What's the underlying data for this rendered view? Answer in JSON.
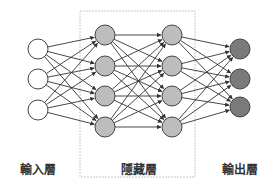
{
  "diagram": {
    "layers": [
      {
        "id": "input",
        "label": "輸入層",
        "x": 38,
        "nodes": [
          49,
          79,
          110
        ],
        "fill": "#ffffff"
      },
      {
        "id": "hidden1",
        "label": "",
        "x": 105,
        "nodes": [
          35,
          66,
          96,
          127
        ],
        "fill": "#bdbdbd"
      },
      {
        "id": "hidden2",
        "label": "",
        "x": 172,
        "nodes": [
          35,
          66,
          96,
          127
        ],
        "fill": "#bdbdbd"
      },
      {
        "id": "output",
        "label": "輸出層",
        "x": 240,
        "nodes": [
          49,
          79,
          107
        ],
        "fill": "#7a7a7a"
      }
    ],
    "hidden_group": {
      "label": "隱藏層",
      "box": {
        "x": 80,
        "y": 11,
        "w": 115,
        "h": 166
      }
    },
    "node_radius": 10,
    "colors": {
      "stroke": "#444444",
      "edge": "#333333",
      "box": "#c8c8c8"
    },
    "labels": {
      "input": "輸入層",
      "hidden": "隱藏層",
      "output": "輸出層"
    }
  }
}
